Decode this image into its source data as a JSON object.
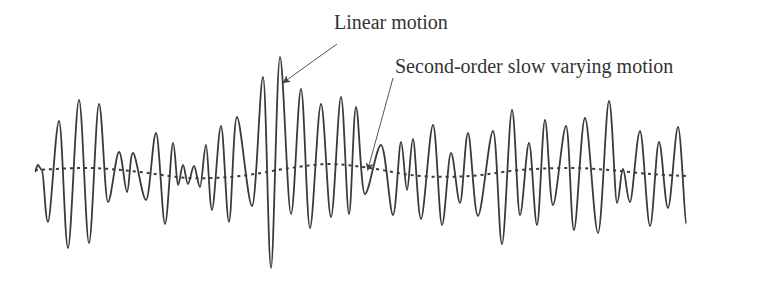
{
  "figure": {
    "labels": {
      "linear": "Linear motion",
      "second_order": "Second-order slow varying motion"
    },
    "colors": {
      "wave": "#3a3a3a",
      "dotted": "#3a3a3a",
      "arrow": "#555555",
      "text": "#333333",
      "background": "#ffffff"
    },
    "series": [
      {
        "name": "Linear motion",
        "style": "solid",
        "points": [
          [
            35,
            172
          ],
          [
            38,
            165
          ],
          [
            42,
            170
          ],
          [
            48,
            222
          ],
          [
            59,
            121
          ],
          [
            68,
            248
          ],
          [
            79,
            100
          ],
          [
            89,
            243
          ],
          [
            99,
            104
          ],
          [
            108,
            202
          ],
          [
            119,
            152
          ],
          [
            127,
            192
          ],
          [
            133,
            153
          ],
          [
            146,
            200
          ],
          [
            156,
            133
          ],
          [
            165,
            224
          ],
          [
            173,
            143
          ],
          [
            178,
            185
          ],
          [
            183,
            165
          ],
          [
            188,
            184
          ],
          [
            194,
            166
          ],
          [
            200,
            187
          ],
          [
            206,
            145
          ],
          [
            212,
            210
          ],
          [
            221,
            126
          ],
          [
            229,
            222
          ],
          [
            237,
            117
          ],
          [
            252,
            206
          ],
          [
            263,
            77
          ],
          [
            271,
            268
          ],
          [
            280,
            57
          ],
          [
            291,
            214
          ],
          [
            301,
            89
          ],
          [
            310,
            228
          ],
          [
            321,
            104
          ],
          [
            331,
            217
          ],
          [
            341,
            97
          ],
          [
            349,
            214
          ],
          [
            356,
            107
          ],
          [
            365,
            194
          ],
          [
            381,
            145
          ],
          [
            393,
            215
          ],
          [
            401,
            142
          ],
          [
            407,
            190
          ],
          [
            413,
            139
          ],
          [
            421,
            219
          ],
          [
            433,
            125
          ],
          [
            442,
            225
          ],
          [
            451,
            153
          ],
          [
            460,
            203
          ],
          [
            468,
            133
          ],
          [
            478,
            216
          ],
          [
            493,
            131
          ],
          [
            502,
            244
          ],
          [
            512,
            110
          ],
          [
            520,
            215
          ],
          [
            529,
            143
          ],
          [
            537,
            225
          ],
          [
            545,
            120
          ],
          [
            553,
            205
          ],
          [
            566,
            126
          ],
          [
            574,
            230
          ],
          [
            585,
            118
          ],
          [
            598,
            233
          ],
          [
            609,
            101
          ],
          [
            617,
            203
          ],
          [
            623,
            169
          ],
          [
            630,
            202
          ],
          [
            640,
            131
          ],
          [
            650,
            226
          ],
          [
            659,
            142
          ],
          [
            668,
            208
          ],
          [
            678,
            127
          ],
          [
            686,
            224
          ]
        ]
      },
      {
        "name": "Second-order slow varying motion",
        "style": "dotted",
        "points": [
          [
            35,
            170
          ],
          [
            90,
            168
          ],
          [
            140,
            172
          ],
          [
            190,
            178
          ],
          [
            240,
            176
          ],
          [
            290,
            168
          ],
          [
            330,
            164
          ],
          [
            370,
            168
          ],
          [
            420,
            176
          ],
          [
            470,
            176
          ],
          [
            520,
            170
          ],
          [
            570,
            168
          ],
          [
            610,
            170
          ],
          [
            650,
            174
          ],
          [
            686,
            176
          ]
        ]
      }
    ],
    "arrows": [
      {
        "name": "linear-motion-arrow",
        "from": [
          337,
          44
        ],
        "to": [
          284,
          82
        ]
      },
      {
        "name": "second-order-arrow",
        "from": [
          393,
          78
        ],
        "to": [
          368,
          169
        ]
      }
    ]
  }
}
